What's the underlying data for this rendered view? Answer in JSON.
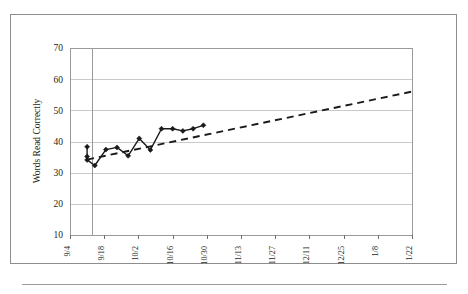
{
  "figure": {
    "frame_color": "#8d8d8d",
    "background": "#ffffff"
  },
  "chart_data": {
    "type": "line",
    "title": "",
    "xlabel": "",
    "ylabel": "Words Read Correctly",
    "ylim": [
      10,
      70
    ],
    "ytick_values": [
      10,
      20,
      30,
      40,
      50,
      60,
      70
    ],
    "ytick_labels": [
      "10",
      "20",
      "30",
      "40",
      "50",
      "60",
      "70"
    ],
    "grid": true,
    "grid_color": "#c9c9c9",
    "legend": "none",
    "x_categories": [
      "9/4",
      "9/11",
      "9/18",
      "9/25",
      "10/2",
      "10/9",
      "10/16",
      "10/23",
      "10/30",
      "11/6",
      "11/13",
      "11/20",
      "11/27",
      "12/4",
      "12/11",
      "12/18",
      "12/25",
      "1/1",
      "1/8",
      "1/15",
      "1/22"
    ],
    "xtick_labels": [
      "9/4",
      "9/18",
      "10/2",
      "10/16",
      "10/30",
      "11/13",
      "11/27",
      "12/11",
      "12/25",
      "1/8",
      "1/22"
    ],
    "xtick_indices": [
      0,
      2,
      4,
      6,
      8,
      10,
      12,
      14,
      16,
      18,
      20
    ],
    "series": [
      {
        "name": "Words Read Correctly",
        "style": "solid",
        "marker": "diamond",
        "color": "#1a1a1a",
        "x": [
          1,
          1,
          1,
          1.45,
          2.1,
          2.75,
          3.4,
          4.05,
          4.7,
          5.35,
          6.0,
          6.6,
          7.2,
          7.8
        ],
        "values": [
          38.3,
          35.2,
          34.1,
          32.3,
          37.4,
          38.1,
          35.4,
          41.0,
          37.3,
          44.1,
          44.1,
          43.4,
          44.1,
          45.2
        ]
      },
      {
        "name": "Trendline",
        "style": "dashed",
        "marker": "none",
        "color": "#1a1a1a",
        "x": [
          1.0,
          20.0
        ],
        "values": [
          34.2,
          56.0
        ]
      }
    ],
    "baseline_divider": {
      "x": 1.0,
      "color": "#9a9a9a",
      "description": "vertical phase line"
    }
  }
}
